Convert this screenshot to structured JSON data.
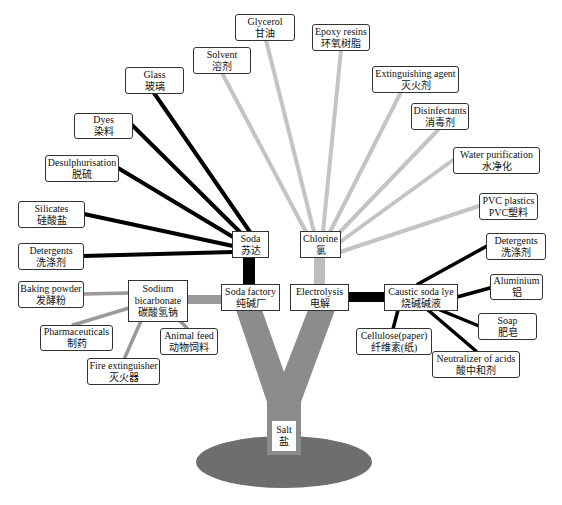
{
  "colors": {
    "soda_edges": "#000000",
    "chlorine_edges": "#bdbdbd",
    "trunk": "#8c8c8c",
    "bicarbonate_edges": "#999999",
    "ground": "#6e6e6e",
    "box_border": "#333333"
  },
  "root": {
    "en": "Salt",
    "zh": "盐"
  },
  "hubs": {
    "soda_factory": {
      "en": "Soda factory",
      "zh": "纯碱厂"
    },
    "electrolysis": {
      "en": "Electrolysis",
      "zh": "电解"
    },
    "soda": {
      "en": "Soda",
      "zh": "苏达"
    },
    "chlorine": {
      "en": "Chlorine",
      "zh": "氯"
    },
    "sodium_bicarbonate": {
      "en1": "Sodium",
      "en2": "bicarbonate",
      "zh": "碳酸氢钠"
    },
    "caustic_soda_lye": {
      "en": "Caustic soda lye",
      "zh": "烧碱碱液"
    }
  },
  "soda_products": [
    {
      "en": "Glass",
      "zh": "玻璃"
    },
    {
      "en": "Dyes",
      "zh": "染料"
    },
    {
      "en": "Desulphurisation",
      "zh": "脱硫"
    },
    {
      "en": "Silicates",
      "zh": "硅酸盐"
    },
    {
      "en": "Detergents",
      "zh": "洗涤剂"
    }
  ],
  "chlorine_products": [
    {
      "en": "Solvent",
      "zh": "溶剂"
    },
    {
      "en": "Glycerol",
      "zh": "甘油"
    },
    {
      "en": "Epoxy resins",
      "zh": "环氧树脂"
    },
    {
      "en": "Extinguishing agent",
      "zh": "灭火剂"
    },
    {
      "en": "Disinfectants",
      "zh": "消毒剂"
    },
    {
      "en": "Water purification",
      "zh": "水净化"
    },
    {
      "en": "PVC plastics",
      "zh": "PVC塑料"
    }
  ],
  "bicarbonate_products": [
    {
      "en": "Baking powder",
      "zh": "发酵粉"
    },
    {
      "en": "Pharmaceuticals",
      "zh": "制药"
    },
    {
      "en": "Fire extinguisher",
      "zh": "灭火器"
    },
    {
      "en": "Animal feed",
      "zh": "动物饲料"
    }
  ],
  "caustic_products": [
    {
      "en": "Detergents",
      "zh": "洗涤剂"
    },
    {
      "en": "Aluminium",
      "zh": "铝"
    },
    {
      "en": "Soap",
      "zh": "肥皂"
    },
    {
      "en": "Neutralizer of acids",
      "zh": "酸中和剂"
    },
    {
      "en": "Cellulose(paper)",
      "zh": "纤维素(纸)"
    }
  ]
}
